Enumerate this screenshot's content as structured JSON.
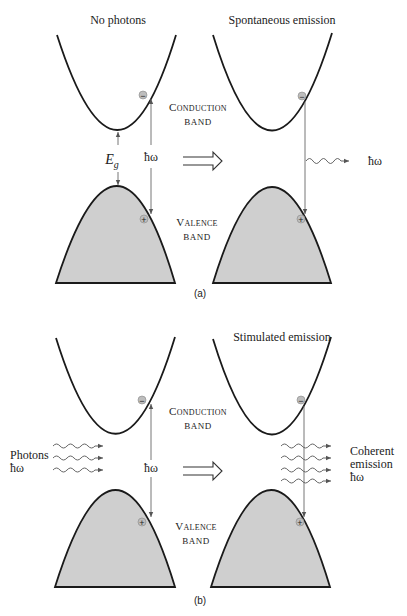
{
  "figure": {
    "part_a": {
      "label": "(a)",
      "left_title": "No photons",
      "right_title": "Spontaneous emission",
      "conduction_label_1": "Conduction",
      "conduction_label_2": "band",
      "valence_label_1": "Valence",
      "valence_label_2": "band",
      "gap_label_E": "E",
      "gap_label_sub": "g",
      "photon_energy_left": "ħω",
      "photon_energy_emitted": "ħω"
    },
    "part_b": {
      "label": "(b)",
      "right_title": "Stimulated emission",
      "conduction_label_1": "Conduction",
      "conduction_label_2": "band",
      "valence_label_1": "Valence",
      "valence_label_2": "band",
      "incoming_label_1": "Photons",
      "incoming_label_2": "ħω",
      "photon_energy": "ħω",
      "outgoing_label_1": "Coherent",
      "outgoing_label_2": "emission",
      "outgoing_label_3": "ħω"
    },
    "symbols": {
      "electron": "−",
      "hole": "+"
    },
    "colors": {
      "band_fill": "#cfcfcf",
      "line": "#1a1a1a"
    }
  }
}
